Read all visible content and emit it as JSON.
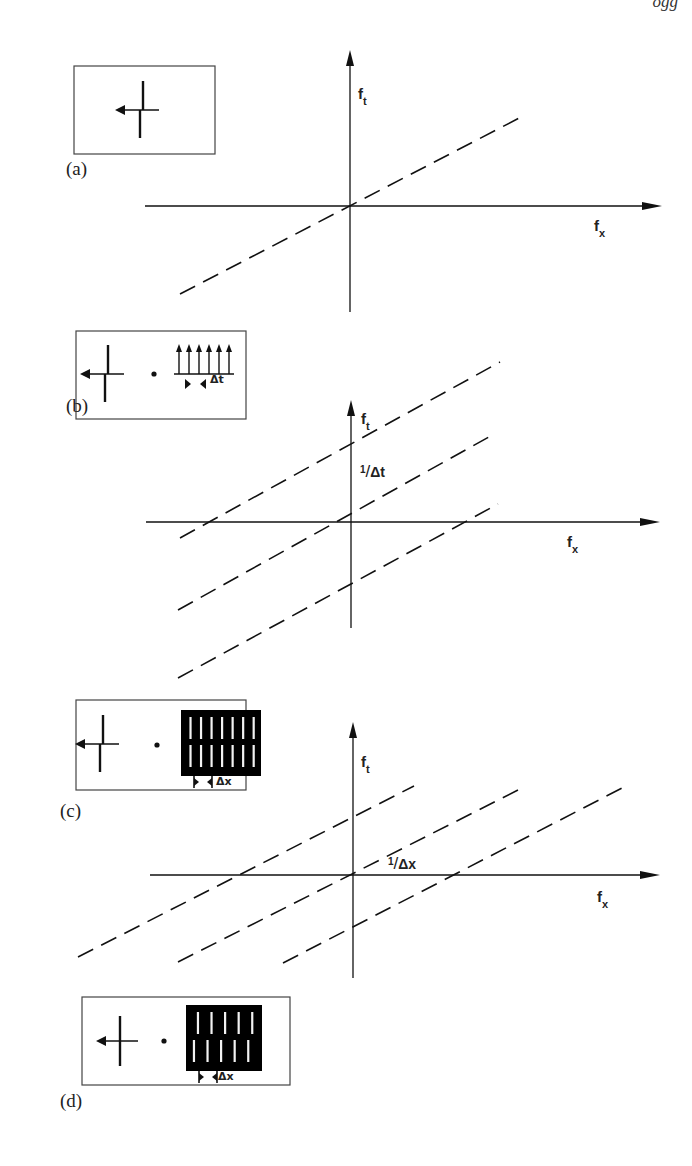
{
  "header": {
    "fragment": "ogg"
  },
  "colors": {
    "ink": "#111111",
    "frame": "#444444",
    "paper": "#ffffff",
    "fill": "#000000"
  },
  "panels": [
    {
      "id": "a",
      "label": "(a)",
      "label_pos": [
        66,
        158
      ],
      "inset": {
        "box": [
          74,
          66,
          141,
          88
        ],
        "contents": [
          "edge-icon"
        ]
      },
      "axes": {
        "origin": [
          350,
          206
        ],
        "x_end": [
          662,
          206
        ],
        "x_start": [
          145,
          206
        ],
        "y_top": [
          350,
          50
        ],
        "y_bottom": [
          350,
          312
        ]
      },
      "x_label": {
        "text": "f",
        "sub": "x",
        "pos": [
          594,
          217
        ]
      },
      "y_label": {
        "text": "f",
        "sub": "t",
        "pos": [
          358,
          85
        ]
      },
      "lines": [
        {
          "from": [
            180,
            294
          ],
          "to": [
            525,
            115
          ]
        }
      ],
      "recip_label": null
    },
    {
      "id": "b",
      "label": "(b)",
      "label_pos": [
        66,
        395
      ],
      "inset": {
        "box": [
          76,
          331,
          170,
          88
        ],
        "contents": [
          "edge-icon",
          "dot-operator",
          "impulse-train-icon"
        ],
        "delta_label": "Δt"
      },
      "axes": {
        "origin": [
          351,
          522
        ],
        "x_end": [
          660,
          522
        ],
        "x_start": [
          146,
          522
        ],
        "y_top": [
          351,
          400
        ],
        "y_bottom": [
          351,
          628
        ]
      },
      "x_label": {
        "text": "f",
        "sub": "x",
        "pos": [
          567,
          533
        ]
      },
      "y_label": {
        "text": "f",
        "sub": "t",
        "pos": [
          361,
          410
        ]
      },
      "lines": [
        {
          "from": [
            180,
            538
          ],
          "to": [
            500,
            362
          ]
        },
        {
          "from": [
            178,
            610
          ],
          "to": [
            496,
            433
          ]
        },
        {
          "from": [
            178,
            678
          ],
          "to": [
            498,
            504
          ]
        }
      ],
      "recip_label": {
        "num": "1",
        "den": "Δt",
        "pos": [
          360,
          462
        ]
      }
    },
    {
      "id": "c",
      "label": "(c)",
      "label_pos": [
        60,
        800
      ],
      "inset": {
        "box": [
          76,
          700,
          170,
          90
        ],
        "contents": [
          "edge-icon",
          "dot-operator",
          "grating-icon-2row-7col"
        ],
        "delta_label": "Δx"
      },
      "axes": {
        "origin": [
          353,
          875
        ],
        "x_end": [
          660,
          875
        ],
        "x_start": [
          150,
          875
        ],
        "y_top": [
          353,
          722
        ],
        "y_bottom": [
          353,
          978
        ]
      },
      "x_label": {
        "text": "f",
        "sub": "x",
        "pos": [
          597,
          888
        ]
      },
      "y_label": {
        "text": "f",
        "sub": "t",
        "pos": [
          361,
          753
        ]
      },
      "lines": [
        {
          "from": [
            78,
            957
          ],
          "to": [
            414,
            786
          ]
        },
        {
          "from": [
            178,
            962
          ],
          "to": [
            520,
            789
          ]
        },
        {
          "from": [
            283,
            963
          ],
          "to": [
            626,
            786
          ]
        }
      ],
      "recip_label": {
        "num": "1",
        "den": "Δx",
        "pos": [
          388,
          854
        ]
      }
    },
    {
      "id": "d",
      "label": "(d)",
      "label_pos": [
        60,
        1090
      ],
      "inset": {
        "box": [
          82,
          997,
          208,
          88
        ],
        "contents": [
          "edge-icon-centered",
          "dot-operator",
          "grating-icon-2row-5col"
        ],
        "delta_label": "Δx"
      },
      "axes": null,
      "lines": [],
      "recip_label": null
    }
  ]
}
